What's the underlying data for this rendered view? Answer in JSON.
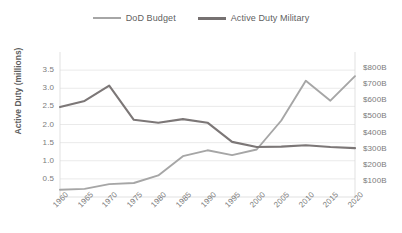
{
  "chart_data": {
    "type": "line",
    "title": "",
    "xlabel": "",
    "ylabel": "Active Duty (millions)",
    "y2label": "",
    "grid": true,
    "legend_position": "top-center",
    "categories": [
      "1960",
      "1965",
      "1970",
      "1975",
      "1980",
      "1985",
      "1990",
      "1995",
      "2000",
      "2005",
      "2010",
      "2015",
      "2020"
    ],
    "x_tick_labels": [
      "1960",
      "1965",
      "1970",
      "1975",
      "1980",
      "1985",
      "1990",
      "1995",
      "2000",
      "2005",
      "2010",
      "2015",
      "2020"
    ],
    "y_tick_labels": [
      "3.5",
      "3.0",
      "2.5",
      "2.0",
      "1.5",
      "1.0",
      "0.5"
    ],
    "y2_tick_labels": [
      "$800B",
      "$700B",
      "$600B",
      "$500B",
      "$400B",
      "$300B",
      "$200B",
      "$100B"
    ],
    "ylim": [
      0.0,
      4.0
    ],
    "y2lim": [
      0,
      900
    ],
    "series": [
      {
        "name": "DoD Budget",
        "axis": "right",
        "unit": "billions USD",
        "color": "#a6a6a6",
        "values": [
          45,
          50,
          80,
          87,
          134,
          253,
          290,
          260,
          295,
          475,
          721,
          598,
          750
        ]
      },
      {
        "name": "Active Duty Military",
        "axis": "left",
        "unit": "millions",
        "color": "#7c7777",
        "values": [
          2.48,
          2.65,
          3.07,
          2.13,
          2.05,
          2.15,
          2.05,
          1.52,
          1.38,
          1.39,
          1.43,
          1.38,
          1.35
        ]
      }
    ]
  },
  "legend": {
    "items": [
      {
        "label": "DoD Budget",
        "style": "budget"
      },
      {
        "label": "Active Duty Military",
        "style": "active"
      }
    ]
  },
  "axes": {
    "left_title": "Active Duty (millions)"
  }
}
